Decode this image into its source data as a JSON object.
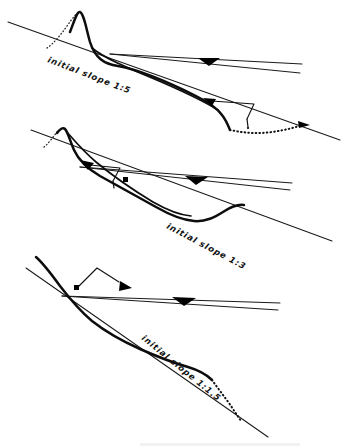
{
  "figure": {
    "background_color": "#ffffff",
    "ink_color": "#111111",
    "panel_count": 3
  },
  "panels": [
    {
      "id": "panel-1",
      "label": "initial slope 1:5",
      "slope_ratio": "1:5",
      "label_rotation_deg": 22,
      "label_x": 47,
      "label_y": 62,
      "water_marker": "water-level-triangle",
      "flow_arrow_direction": "up-left",
      "has_dotted_scour": true,
      "has_dotted_peak_flank": true
    },
    {
      "id": "panel-2",
      "label": "initial slope 1:3",
      "slope_ratio": "1:3",
      "label_rotation_deg": 27,
      "label_x": 166,
      "label_y": 228,
      "water_marker": "water-level-triangle",
      "flow_arrow_direction": "up-left",
      "has_dotted_scour": false,
      "has_dotted_peak_flank": true
    },
    {
      "id": "panel-3",
      "label": "initial slope 1:1.5",
      "slope_ratio": "1:1.5",
      "label_rotation_deg": 38,
      "label_x": 141,
      "label_y": 339,
      "water_marker": "water-level-triangle",
      "flow_arrow_direction": "down-right",
      "has_dotted_scour": true,
      "has_dotted_peak_flank": false
    }
  ],
  "geometry": {
    "panel1": {
      "slope_line": "M 8,22 L 340,140",
      "water_line": "M 108,53 L 300,65",
      "water_line_lower": "M 108,53 L 300,72",
      "profile": "M 47,48 C 56,44 62,34 70,21 C 74,14 77,10 80,12 C 84,15 86,28 90,42 C 95,58 104,64 118,66 C 140,70 168,82 196,96 C 210,103 216,108 221,114 C 225,119 227,124 229,129",
      "peak_dotted": "M 47,48 C 53,44 60,36 67,26 C 72,19 76,13 80,12",
      "scour_dotted": "M 229,129 C 244,132 258,133 272,131 C 286,129 297,126 306,124",
      "leader": "M 212,101 L 254,104 L 246,118",
      "leader_tick": "M 246,118 L 247,126",
      "arrow_tip": "205,99",
      "arrow_dir": "up-left",
      "end_arrow": "306,124",
      "end_arrow_dir": "down-right"
    },
    "panel2": {
      "slope_line": "M 31,130 L 330,239",
      "water_line": "M 78,166 L 290,182",
      "water_line_lower": "M 78,166 L 290,189",
      "profile": "M 44,147 C 50,144 54,139 58,133 C 61,129 63,127 65,129 C 68,132 70,141 74,150 C 79,161 88,168 100,175 C 118,185 138,196 156,206 C 170,214 182,219 194,220 C 206,221 214,216 222,211 C 230,206 236,203 243,204",
      "profile_second": "M 65,129 C 72,138 82,150 95,161 C 112,175 132,189 152,201 C 166,209 178,214 190,215",
      "peak_dotted": "M 44,147 C 49,143 53,137 57,132 C 60,129 63,127 65,129",
      "leader": "M 88,164 L 118,167 L 112,180",
      "leader_tick": "M 112,180 L 113,187",
      "arrow_tip": "81,161",
      "arrow_dir": "up-left",
      "water_tick": "125,178"
    },
    "panel3": {
      "slope_line": "M 26,268 L 265,433",
      "water_line": "M 62,295 L 278,302",
      "water_line_lower": "M 62,295 L 278,309",
      "profile": "M 36,257 C 44,264 52,274 60,285 C 70,298 80,310 92,320 C 106,331 122,340 140,348 C 158,356 174,362 188,366 C 198,369 205,373 211,379",
      "dotted_tail": "M 211,379 C 216,386 222,394 228,402 C 232,408 236,414 240,420",
      "leader": "M 76,287 L 96,268 L 118,281",
      "leader_tick": "M 76,287 L 75,288",
      "arrow_tip": "128,288",
      "arrow_dir": "down-right",
      "square_dot": "76,287"
    }
  },
  "caption": {
    "text": "",
    "visible": false
  }
}
